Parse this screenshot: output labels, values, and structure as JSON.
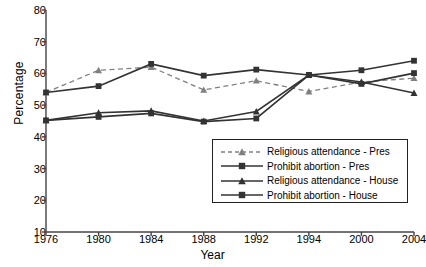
{
  "chart_data": {
    "type": "line",
    "title": "",
    "xlabel": "Year",
    "ylabel": "Percentage",
    "categories": [
      "1976",
      "1980",
      "1984",
      "1988",
      "1992",
      "1994",
      "2000",
      "2004"
    ],
    "ylim": [
      10,
      80
    ],
    "yticks": [
      10,
      20,
      30,
      40,
      50,
      60,
      70,
      80
    ],
    "grid": false,
    "legend_position": "inside-bottom-right",
    "series": [
      {
        "name": "Religious attendance - Pres",
        "marker": "triangle",
        "linestyle": "dashed",
        "color": "#808080",
        "values": [
          54.0,
          61.0,
          62.0,
          54.8,
          57.7,
          54.3,
          57.3,
          58.5
        ]
      },
      {
        "name": "Prohibit abortion - Pres",
        "marker": "square",
        "linestyle": "solid",
        "color": "#333333",
        "values": [
          45.2,
          46.3,
          47.4,
          44.8,
          45.8,
          59.5,
          56.7,
          60.1
        ]
      },
      {
        "name": "Religious attendance - House",
        "marker": "triangle",
        "linestyle": "solid",
        "color": "#333333",
        "values": [
          45.2,
          47.6,
          48.2,
          45.0,
          48.0,
          59.5,
          57.3,
          53.8
        ]
      },
      {
        "name": "Prohibit abortion - House",
        "marker": "square",
        "linestyle": "solid",
        "color": "#333333",
        "values": [
          54.0,
          56.0,
          63.0,
          59.3,
          61.2,
          59.5,
          61.0,
          64.0
        ]
      }
    ]
  }
}
